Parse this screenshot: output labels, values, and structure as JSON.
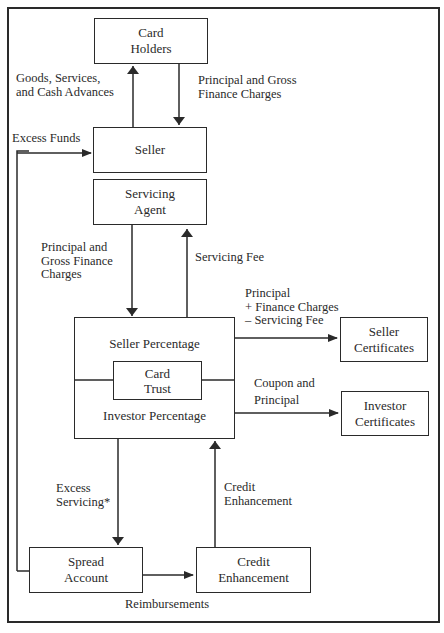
{
  "diagram": {
    "boxes": {
      "card_holders": "Card\nHolders",
      "seller": "Seller",
      "servicing_agent": "Servicing\nAgent",
      "seller_percentage": "Seller Percentage",
      "card_trust": "Card\nTrust",
      "investor_percentage": "Investor Percentage",
      "seller_certificates": "Seller\nCertificates",
      "investor_certificates": "Investor\nCertificates",
      "spread_account": "Spread\nAccount",
      "credit_enhancement": "Credit\nEnhancement"
    },
    "flows": {
      "goods_services": "Goods, Services,\nand Cash Advances",
      "principal_gross_top": "Principal and Gross\nFinance Charges",
      "excess_funds": "Excess Funds",
      "principal_gross_mid": "Principal and\nGross Finance\nCharges",
      "servicing_fee": "Servicing Fee",
      "principal_finance_servicing": "Principal\n+ Finance Charges\n– Servicing Fee",
      "coupon_principal": "Coupon and\nPrincipal",
      "excess_servicing": "Excess\nServicing*",
      "credit_enhancement_flow": "Credit\nEnhancement",
      "reimbursements": "Reimbursements"
    }
  }
}
